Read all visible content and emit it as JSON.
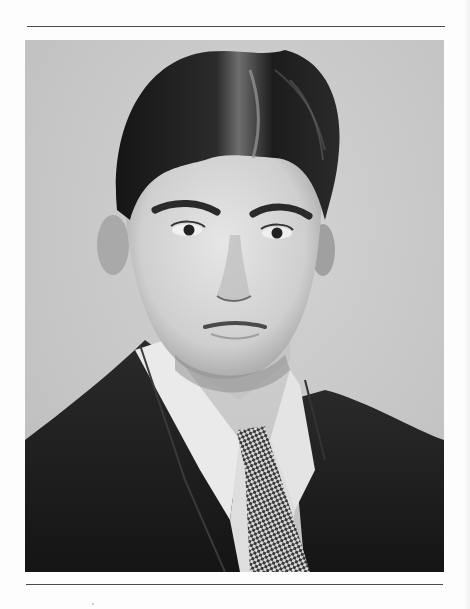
{
  "page": {
    "type": "scanned-portrait-page",
    "background_color": "#fdfdfd",
    "rule_color": "#4a4a4a"
  },
  "photo": {
    "description": "Black-and-white studio portrait of a young man with wavy side-parted hair, white collared shirt, dark suit jacket and checkered tie",
    "tone": "grayscale",
    "background_tone": "#c9c9c9",
    "hair_tone": "#1e1e1e",
    "skin_tone": "#d9d9d9",
    "shirt_tone": "#ececec",
    "suit_tone": "#1a1a1a",
    "tie_pattern": "checkered"
  }
}
